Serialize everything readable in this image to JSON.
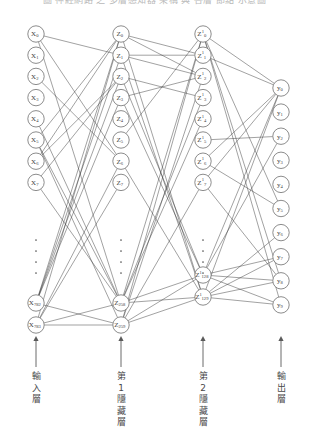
{
  "figure": {
    "top_caption": "圖 神經網路 之 多層感知器 架構 與 各層 節點 示意圖",
    "type": "neural-network-diagram",
    "background_color": "#ffffff",
    "node_stroke_color": "#6e6e6e",
    "edge_color": "#2f2f2f",
    "text_color": "#3d3d3d"
  },
  "layers": [
    {
      "id": "input",
      "caption": "輸入層",
      "caption_chars": [
        "輸",
        "入",
        "層"
      ],
      "center_x": 36,
      "node_symbol": "X",
      "has_superscript": false,
      "superscript": "",
      "top_nodes": [
        {
          "label": "X",
          "sub": "0"
        },
        {
          "label": "X",
          "sub": "1"
        },
        {
          "label": "X",
          "sub": "2"
        },
        {
          "label": "X",
          "sub": "3"
        },
        {
          "label": "X",
          "sub": "4"
        },
        {
          "label": "X",
          "sub": "5"
        },
        {
          "label": "X",
          "sub": "6"
        },
        {
          "label": "X",
          "sub": "7"
        }
      ],
      "has_ellipsis": true,
      "ellipsis_dots": 4,
      "bottom_nodes": [
        {
          "label": "X",
          "sub": "782"
        },
        {
          "label": "X",
          "sub": "783"
        }
      ],
      "total_units": 784
    },
    {
      "id": "hidden-1",
      "caption": "第1隱藏層",
      "caption_chars": [
        "第",
        "1",
        "隱",
        "藏",
        "層"
      ],
      "center_x": 121,
      "node_symbol": "Z",
      "has_superscript": false,
      "superscript": "",
      "top_nodes": [
        {
          "label": "Z",
          "sub": "0"
        },
        {
          "label": "Z",
          "sub": "1"
        },
        {
          "label": "Z",
          "sub": "2"
        },
        {
          "label": "Z",
          "sub": "3"
        },
        {
          "label": "Z",
          "sub": "4"
        },
        {
          "label": "Z",
          "sub": "5"
        },
        {
          "label": "Z",
          "sub": "6"
        },
        {
          "label": "Z",
          "sub": "7"
        }
      ],
      "has_ellipsis": true,
      "ellipsis_dots": 4,
      "bottom_nodes": [
        {
          "label": "Z",
          "sub": "258"
        },
        {
          "label": "Z",
          "sub": "259"
        }
      ],
      "total_units": 260
    },
    {
      "id": "hidden-2",
      "caption": "第2隱藏層",
      "caption_chars": [
        "第",
        "2",
        "隱",
        "藏",
        "層"
      ],
      "center_x": 203,
      "node_symbol": "Z",
      "has_superscript": true,
      "superscript": "1",
      "top_nodes": [
        {
          "label": "Z",
          "sub": "0",
          "sup": "1"
        },
        {
          "label": "Z",
          "sub": "1",
          "sup": "1"
        },
        {
          "label": "Z",
          "sub": "2",
          "sup": "1"
        },
        {
          "label": "Z",
          "sub": "3",
          "sup": "1"
        },
        {
          "label": "Z",
          "sub": "4",
          "sup": "1"
        },
        {
          "label": "Z",
          "sub": "5",
          "sup": "1"
        },
        {
          "label": "Z",
          "sub": "6",
          "sup": "1"
        },
        {
          "label": "Z",
          "sub": "7",
          "sup": "1"
        }
      ],
      "has_ellipsis": true,
      "ellipsis_dots": 4,
      "bottom_nodes": [
        {
          "label": "Z",
          "sub": "128",
          "sup": "1"
        },
        {
          "label": "Z",
          "sub": "129",
          "sup": "1"
        }
      ],
      "total_units": 130
    },
    {
      "id": "output",
      "caption": "輸出層",
      "caption_chars": [
        "輸",
        "出",
        "層"
      ],
      "center_x": 281,
      "node_symbol": "y",
      "has_superscript": false,
      "superscript": "",
      "top_nodes": [
        {
          "label": "y",
          "sub": "0"
        },
        {
          "label": "y",
          "sub": "1"
        },
        {
          "label": "y",
          "sub": "2"
        },
        {
          "label": "y",
          "sub": "3"
        },
        {
          "label": "y",
          "sub": "4"
        },
        {
          "label": "y",
          "sub": "5"
        },
        {
          "label": "y",
          "sub": "6"
        },
        {
          "label": "y",
          "sub": "7"
        },
        {
          "label": "y",
          "sub": "8"
        },
        {
          "label": "y",
          "sub": "9"
        }
      ],
      "has_ellipsis": false,
      "ellipsis_dots": 0,
      "bottom_nodes": [],
      "total_units": 10
    }
  ]
}
